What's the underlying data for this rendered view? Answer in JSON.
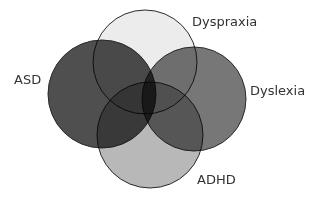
{
  "diagram": {
    "type": "venn",
    "sets": [
      {
        "id": "asd",
        "label": "ASD",
        "fill": "#4f4f4f",
        "cx": 102,
        "cy": 94,
        "r": 54,
        "label_x": 14,
        "label_y": 73
      },
      {
        "id": "dyspraxia",
        "label": "Dyspraxia",
        "fill": "#ececec",
        "cx": 145,
        "cy": 62,
        "r": 52,
        "label_x": 192,
        "label_y": 15
      },
      {
        "id": "dyslexia",
        "label": "Dyslexia",
        "fill": "#777777",
        "cx": 194,
        "cy": 99,
        "r": 52,
        "label_x": 250,
        "label_y": 84
      },
      {
        "id": "adhd",
        "label": "ADHD",
        "fill": "#b8b8b8",
        "cx": 150,
        "cy": 135,
        "r": 53,
        "label_x": 197,
        "label_y": 173
      }
    ]
  }
}
